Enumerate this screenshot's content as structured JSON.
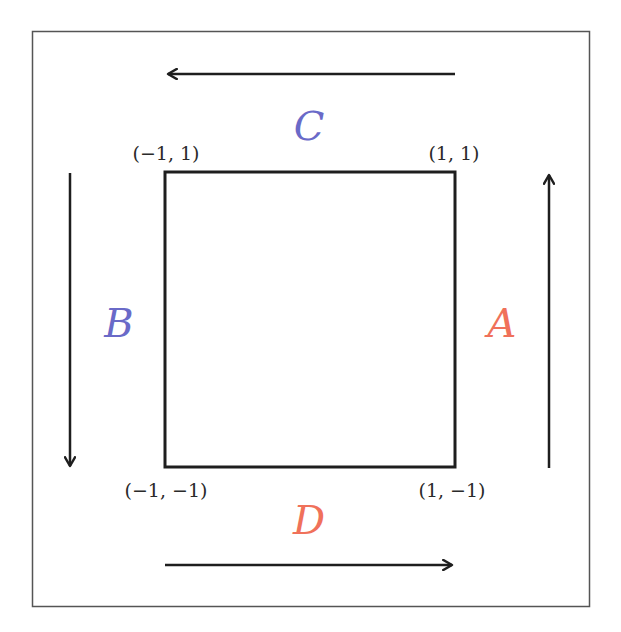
{
  "diagram": {
    "type": "square-contour",
    "frame": {
      "x": 32,
      "y": 31,
      "width": 557,
      "height": 575,
      "stroke": "#555555"
    },
    "square": {
      "x": 164,
      "y": 171,
      "width": 291,
      "height": 296,
      "stroke": "#1e1e1e"
    },
    "vertices": {
      "top_left": "(−1, 1)",
      "top_right": "(1, 1)",
      "bottom_left": "(−1, −1)",
      "bottom_right": "(1, −1)"
    },
    "edges": {
      "A": {
        "label": "A",
        "color": "#f0715a",
        "side": "right",
        "direction": "up"
      },
      "B": {
        "label": "B",
        "color": "#6a6ac8",
        "side": "left",
        "direction": "down"
      },
      "C": {
        "label": "C",
        "color": "#6a6ac8",
        "side": "top",
        "direction": "left"
      },
      "D": {
        "label": "D",
        "color": "#f0715a",
        "side": "bottom",
        "direction": "right"
      }
    },
    "arrow_color": "#1e1e1e"
  }
}
